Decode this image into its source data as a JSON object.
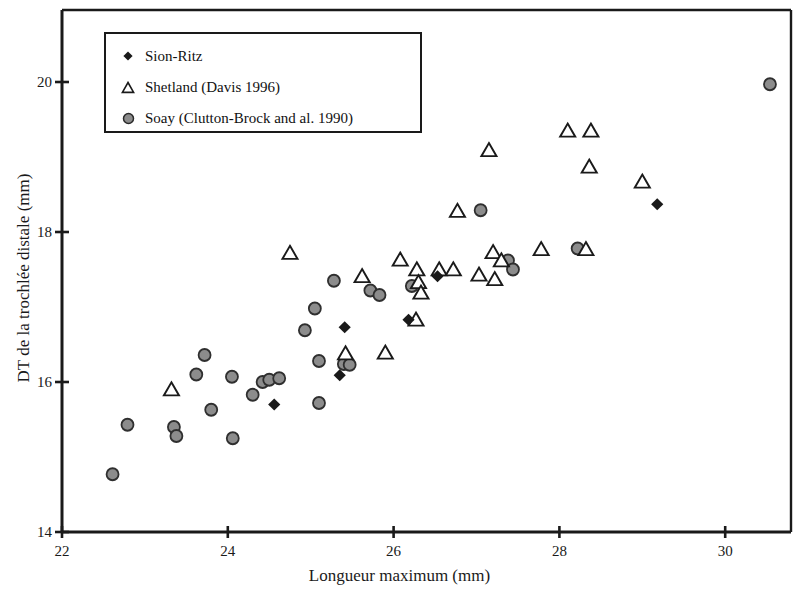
{
  "chart_data": {
    "type": "scatter",
    "title": "",
    "xlabel": "Longueur maximum (mm)",
    "ylabel": "DT de la trochlée distale (mm)",
    "xlim": [
      22,
      30.8
    ],
    "ylim": [
      14,
      20.2
    ],
    "xticks": [
      22,
      24,
      26,
      28,
      30
    ],
    "yticks": [
      14,
      16,
      18,
      20
    ],
    "xtick_labels": [
      "22",
      "24",
      "26",
      "28",
      "30"
    ],
    "ytick_labels": [
      "14",
      "16",
      "18",
      "20"
    ],
    "grid": false,
    "legend_position": "upper-left",
    "frame": "box",
    "series": [
      {
        "name": "Sion-Ritz",
        "marker": "diamond",
        "marker_symbol": "♦",
        "color": "#1a1a1a",
        "points": [
          [
            24.56,
            15.7
          ],
          [
            25.41,
            16.73
          ],
          [
            25.35,
            16.09
          ],
          [
            26.18,
            16.83
          ],
          [
            26.53,
            17.41
          ],
          [
            29.18,
            18.37
          ]
        ]
      },
      {
        "name": "Shetland (Davis 1996)",
        "marker": "triangle",
        "marker_symbol": "△",
        "color": "#1a1a1a",
        "points": [
          [
            23.32,
            15.9
          ],
          [
            24.75,
            17.72
          ],
          [
            25.42,
            16.38
          ],
          [
            25.62,
            17.41
          ],
          [
            25.9,
            16.39
          ],
          [
            26.08,
            17.63
          ],
          [
            26.28,
            17.5
          ],
          [
            26.3,
            17.33
          ],
          [
            26.33,
            17.19
          ],
          [
            26.27,
            16.83
          ],
          [
            26.55,
            17.5
          ],
          [
            26.72,
            17.5
          ],
          [
            26.77,
            18.28
          ],
          [
            27.03,
            17.43
          ],
          [
            27.15,
            19.09
          ],
          [
            27.2,
            17.73
          ],
          [
            27.3,
            17.62
          ],
          [
            27.22,
            17.37
          ],
          [
            27.78,
            17.77
          ],
          [
            28.32,
            17.77
          ],
          [
            28.1,
            19.35
          ],
          [
            28.38,
            19.35
          ],
          [
            28.36,
            18.87
          ],
          [
            29.0,
            18.67
          ]
        ]
      },
      {
        "name": "Soay (Clutton-Brock and al. 1990)",
        "marker": "circle",
        "marker_symbol": "◉",
        "color": "#8c8c8c",
        "points": [
          [
            22.61,
            14.77
          ],
          [
            22.79,
            15.43
          ],
          [
            23.35,
            15.4
          ],
          [
            23.38,
            15.28
          ],
          [
            23.62,
            16.1
          ],
          [
            23.72,
            16.36
          ],
          [
            23.8,
            15.63
          ],
          [
            24.05,
            16.07
          ],
          [
            24.06,
            15.25
          ],
          [
            24.3,
            15.83
          ],
          [
            24.42,
            16.0
          ],
          [
            24.5,
            16.03
          ],
          [
            24.62,
            16.05
          ],
          [
            25.05,
            16.98
          ],
          [
            24.93,
            16.69
          ],
          [
            25.1,
            16.28
          ],
          [
            25.1,
            15.72
          ],
          [
            25.28,
            17.35
          ],
          [
            25.4,
            16.24
          ],
          [
            25.47,
            16.23
          ],
          [
            25.72,
            17.22
          ],
          [
            25.83,
            17.16
          ],
          [
            26.22,
            17.28
          ],
          [
            27.05,
            18.29
          ],
          [
            27.38,
            17.62
          ],
          [
            27.44,
            17.5
          ],
          [
            28.22,
            17.78
          ],
          [
            30.54,
            19.97
          ]
        ]
      }
    ]
  },
  "legend": {
    "items": [
      {
        "label": "Sion-Ritz",
        "marker": "diamond"
      },
      {
        "label": "Shetland (Davis 1996)",
        "marker": "triangle"
      },
      {
        "label": "Soay (Clutton-Brock and al. 1990)",
        "marker": "circle"
      }
    ]
  }
}
